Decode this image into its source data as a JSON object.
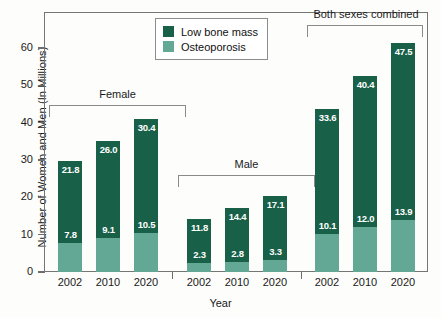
{
  "chart_data": {
    "type": "bar",
    "stacked": true,
    "title": "",
    "xlabel": "Year",
    "ylabel": "Number of Women and Men (In Millions)",
    "ylim": [
      0,
      65
    ],
    "yticks": [
      0,
      10,
      20,
      30,
      40,
      50,
      60
    ],
    "grid": false,
    "legend_position": "top-center",
    "categories": [
      "2002",
      "2010",
      "2020"
    ],
    "groups": [
      {
        "name": "Female",
        "categories": [
          "2002",
          "2010",
          "2020"
        ],
        "series": [
          {
            "name": "Osteoporosis",
            "values": [
              7.8,
              9.1,
              10.5
            ]
          },
          {
            "name": "Low bone mass",
            "values": [
              21.8,
              26.0,
              30.4
            ]
          }
        ],
        "totals": [
          29.6,
          35.1,
          40.9
        ]
      },
      {
        "name": "Male",
        "categories": [
          "2002",
          "2010",
          "2020"
        ],
        "series": [
          {
            "name": "Osteoporosis",
            "values": [
              2.3,
              2.8,
              3.3
            ]
          },
          {
            "name": "Low bone mass",
            "values": [
              11.8,
              14.4,
              17.1
            ]
          }
        ],
        "totals": [
          14.1,
          17.2,
          20.4
        ]
      },
      {
        "name": "Both sexes combined",
        "categories": [
          "2002",
          "2010",
          "2020"
        ],
        "series": [
          {
            "name": "Osteoporosis",
            "values": [
              10.1,
              12.0,
              13.9
            ]
          },
          {
            "name": "Low bone mass",
            "values": [
              33.6,
              40.4,
              47.5
            ]
          }
        ],
        "totals": [
          43.7,
          52.4,
          61.4
        ]
      }
    ],
    "legend": [
      {
        "label": "Low bone mass",
        "color": "#186048"
      },
      {
        "label": "Osteoporosis",
        "color": "#62a894"
      }
    ],
    "colors": {
      "low_bone_mass": "#186048",
      "osteoporosis": "#62a894",
      "axis": "#757575",
      "text": "#1a1a1a",
      "label_on_bar": "#ffffff",
      "background": "#fdfdfc"
    }
  }
}
